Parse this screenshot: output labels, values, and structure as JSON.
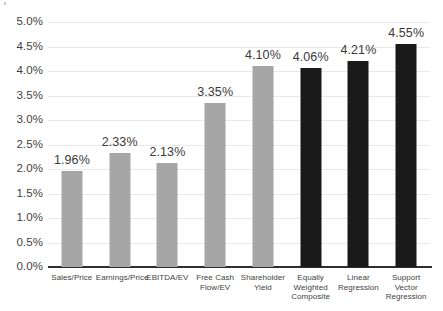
{
  "chart_data": {
    "type": "bar",
    "title": "",
    "subtitle": "",
    "xlabel": "",
    "ylabel": "",
    "ylim": [
      0.0,
      5.0
    ],
    "ytick_values": [
      5.0,
      4.5,
      4.0,
      3.5,
      3.0,
      2.5,
      2.0,
      1.5,
      1.0,
      0.5,
      0.0
    ],
    "ytick_labels": [
      "5.0%",
      "4.5%",
      "4.0%",
      "3.5%",
      "3.0%",
      "2.5%",
      "2.0%",
      "1.5%",
      "1.0%",
      "0.5%",
      "0.0%"
    ],
    "grid": true,
    "grid_axis": "y",
    "legend": false,
    "legend_position": "none",
    "categories": [
      "Sales/Price",
      "Earnings/Price",
      "EBITDA/EV",
      "Free Cash Flow/EV",
      "Shareholder Yield",
      "Equally Weighted Composite",
      "Linear Regression",
      "Support Vector Regression"
    ],
    "category_lines": [
      [
        "Sales/Price"
      ],
      [
        "Earnings/Price"
      ],
      [
        "EBITDA/EV"
      ],
      [
        "Free Cash",
        "Flow/EV"
      ],
      [
        "Shareholder",
        "Yield"
      ],
      [
        "Equally",
        "Weighted",
        "Composite"
      ],
      [
        "Linear",
        "Regression"
      ],
      [
        "Support",
        "Vector",
        "Regression"
      ]
    ],
    "values": [
      1.96,
      2.33,
      2.13,
      3.35,
      4.1,
      4.06,
      4.21,
      4.55
    ],
    "data_labels": [
      "1.96%",
      "2.33%",
      "2.13%",
      "3.35%",
      "4.10%",
      "4.06%",
      "4.21%",
      "4.55%"
    ],
    "bar_colors": [
      "#a6a6a6",
      "#a6a6a6",
      "#a6a6a6",
      "#a6a6a6",
      "#a6a6a6",
      "#1a1a1a",
      "#1a1a1a",
      "#1a1a1a"
    ],
    "colors": {
      "factor_bar": "#a6a6a6",
      "model_bar": "#1a1a1a",
      "gridline": "#e9e9e9",
      "axis_line": "#2e2e2e",
      "text": "#3f3f3f",
      "background": "#ffffff"
    }
  }
}
